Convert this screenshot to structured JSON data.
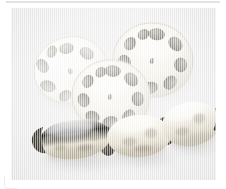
{
  "image": {
    "title": "Lotus root (renkon)",
    "alt_text": "Three lotus root cross-section slices above a whole three-segment lotus rhizome",
    "background_color": "#f0f0f0",
    "frame_color": "#ffffff",
    "border_color": "#e3e3e3",
    "width": 226,
    "height": 189
  },
  "subject": {
    "name": "lotus-root",
    "common_name": "Lotus root",
    "alternate_name": "Renkon",
    "flesh_color": "#f6f4ee",
    "hole_color": "#9a9a96",
    "skin_color": "#ddd6c6",
    "blemish_color": "#8d8472",
    "tip_color": "#2e2a24"
  },
  "slices": [
    {
      "id": "slice-left",
      "label": "Cross-section slice, upper left",
      "cx": 60,
      "cy": 62,
      "rx": 37,
      "ry": 33,
      "rotation": -12,
      "outer_holes": 8,
      "center_hole": true,
      "exposure": "overexposed",
      "fill": "#fbfaf7"
    },
    {
      "id": "slice-right",
      "label": "Cross-section slice, upper right",
      "cx": 142,
      "cy": 52,
      "rx": 40,
      "ry": 37,
      "rotation": 8,
      "outer_holes": 9,
      "center_hole": true,
      "exposure": "normal",
      "fill": "#f7f5f0"
    },
    {
      "id": "slice-middle",
      "label": "Cross-section slice, front centre",
      "cx": 100,
      "cy": 88,
      "rx": 39,
      "ry": 36,
      "rotation": 4,
      "outer_holes": 9,
      "center_hole": true,
      "exposure": "normal",
      "fill": "#f8f6f1"
    }
  ],
  "rhizome": {
    "id": "whole-lotus-root",
    "label": "Whole lotus root, three segments",
    "segment_count": 3,
    "segments": [
      {
        "id": "segment-left",
        "label": "Left segment",
        "cx": 64,
        "cy": 131,
        "rx": 34,
        "ry": 20,
        "rotation": -7
      },
      {
        "id": "segment-middle",
        "label": "Middle segment",
        "cx": 128,
        "cy": 128,
        "rx": 31,
        "ry": 21,
        "rotation": -4
      },
      {
        "id": "segment-right",
        "label": "Right segment",
        "cx": 180,
        "cy": 116,
        "rx": 28,
        "ry": 22,
        "rotation": -10
      }
    ],
    "joints": [
      {
        "id": "joint-left",
        "label": "Joint between left and middle segment",
        "x": 96,
        "y": 131
      },
      {
        "id": "joint-right",
        "label": "Joint between middle and right segment",
        "x": 154,
        "y": 121
      }
    ],
    "tips": [
      {
        "id": "tip-left",
        "label": "Cut dark tip, left end",
        "x": 29,
        "y": 130
      },
      {
        "id": "tip-right",
        "label": "Cut dark tip, right end",
        "x": 207,
        "y": 107
      }
    ]
  }
}
